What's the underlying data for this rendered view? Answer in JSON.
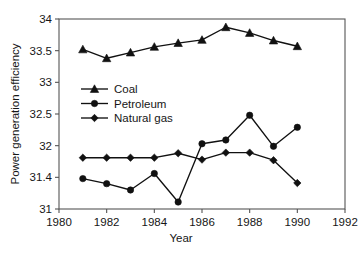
{
  "chart_data": {
    "type": "line",
    "title": "",
    "xlabel": "Year",
    "ylabel": "Power generation efficiency",
    "xlim": [
      1980,
      1992
    ],
    "ylim": [
      31,
      34
    ],
    "grid": false,
    "legend_position": "upper-left-inside",
    "x_ticks": [
      1980,
      1982,
      1984,
      1986,
      1988,
      1990,
      1992
    ],
    "x_tick_labels": [
      "1980",
      "1982",
      "1984",
      "1986",
      "1988",
      "1990",
      "1992"
    ],
    "y_ticks": [
      31,
      31.5,
      32,
      32.5,
      33,
      33.5,
      34
    ],
    "y_tick_labels": [
      "31",
      "31.4",
      "32",
      "32.5",
      "33",
      "33.5",
      "34"
    ],
    "x": [
      1981,
      1982,
      1983,
      1984,
      1985,
      1986,
      1987,
      1988,
      1989,
      1990
    ],
    "series": [
      {
        "name": "Coal",
        "marker": "triangle",
        "values": [
          33.52,
          33.38,
          33.47,
          33.56,
          33.62,
          33.67,
          33.87,
          33.78,
          33.66,
          33.57
        ]
      },
      {
        "name": "Petroleum",
        "marker": "circle",
        "values": [
          31.48,
          31.4,
          31.3,
          31.56,
          31.11,
          32.03,
          32.09,
          32.48,
          31.99,
          32.29
        ]
      },
      {
        "name": "Natural gas",
        "marker": "diamond",
        "values": [
          31.81,
          31.81,
          31.81,
          31.81,
          31.88,
          31.78,
          31.89,
          31.89,
          31.77,
          31.41
        ]
      }
    ]
  }
}
